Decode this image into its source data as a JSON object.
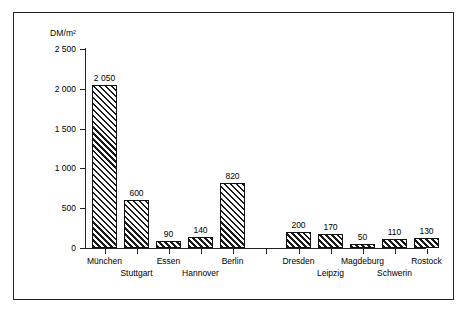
{
  "chart_data": {
    "type": "bar",
    "title": "",
    "subtitle": "",
    "xlabel": "",
    "ylabel": "DM/m²",
    "ylim": [
      0,
      2500
    ],
    "grid": false,
    "legend": "none",
    "ytick_labels": [
      "0",
      "500",
      "1 000",
      "1 500",
      "2 000",
      "2 500"
    ],
    "ytick_values": [
      0,
      500,
      1000,
      1500,
      2000,
      2500
    ],
    "categories": [
      "München",
      "Stuttgart",
      "Essen",
      "Hannover",
      "Berlin",
      "Dresden",
      "Leipzig",
      "Magdeburg",
      "Schwerin",
      "Rostock"
    ],
    "values": [
      2050,
      600,
      90,
      140,
      820,
      200,
      170,
      50,
      110,
      130
    ],
    "value_labels": [
      "2 050",
      "600",
      "90",
      "140",
      "820",
      "200",
      "170",
      "50",
      "110",
      "130"
    ],
    "groups": [
      {
        "name": "west",
        "categories": [
          "München",
          "Stuttgart",
          "Essen",
          "Hannover",
          "Berlin"
        ]
      },
      {
        "name": "east",
        "categories": [
          "Dresden",
          "Leipzig",
          "Magdeburg",
          "Schwerin",
          "Rostock"
        ]
      }
    ],
    "label_rows": [
      "top",
      "bottom",
      "top",
      "bottom",
      "top",
      "top",
      "bottom",
      "top",
      "bottom",
      "top"
    ],
    "bar_fill": "diagonal-hatch",
    "colors": {
      "bar_line": "#111111",
      "axis": "#222222",
      "background": "#ffffff"
    }
  },
  "figure": {
    "unit_label": "DM/m²"
  }
}
